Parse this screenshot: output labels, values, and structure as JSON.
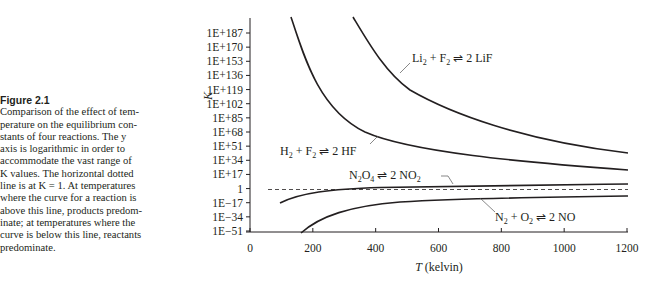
{
  "figure": {
    "label": "Figure 2.1",
    "caption_lines": [
      "Comparison of the effect of tem-",
      "perature on the equilibrium con-",
      "stants of four reactions. The y",
      "axis is logarithmic in order to",
      "accommodate the vast range of",
      "K values. The horizontal dotted",
      "line is at K = 1. At temperatures",
      "where the curve for a reaction is",
      "above this line, products predom-",
      "inate; at temperatures where the",
      "curve is below this line, reactants",
      "predominate."
    ]
  },
  "chart_data": {
    "type": "line",
    "title": "",
    "xlabel": "T (kelvin)",
    "ylabel": "K",
    "xlim": [
      0,
      1200
    ],
    "ylog": true,
    "ylim_log10": [
      -51,
      187
    ],
    "x_ticks": [
      "0",
      "200",
      "400",
      "600",
      "800",
      "1000",
      "1200"
    ],
    "y_ticks": [
      "1E+187",
      "1E+170",
      "1E+153",
      "1E+136",
      "1E+119",
      "1E+102",
      "1E+85",
      "1E+68",
      "1E+51",
      "1E+34",
      "1E+17",
      "1",
      "1E−17",
      "1E−34",
      "1E−51"
    ],
    "grid": false,
    "reference_line": {
      "y": 1,
      "style": "dashed",
      "label": "K = 1"
    },
    "series": [
      {
        "name": "Li2 + F2 ⇌ 2 LiF",
        "x_T": [
          328,
          400,
          450,
          600,
          800,
          1000,
          1200
        ],
        "log10_K": [
          205,
          163,
          140,
          109,
          85,
          65,
          44
        ]
      },
      {
        "name": "H2 + F2 ⇌ 2 HF",
        "x_T": [
          130,
          190,
          270,
          380,
          600,
          900,
          1200
        ],
        "log10_K": [
          205,
          155,
          94,
          65,
          45,
          31,
          23
        ]
      },
      {
        "name": "N2O4 ⇌ 2 NO2",
        "x_T": [
          100,
          200,
          300,
          400,
          600,
          900,
          1200
        ],
        "log10_K": [
          -17,
          -7,
          -1,
          1.5,
          3,
          5,
          6
        ]
      },
      {
        "name": "N2 + O2 ⇌ 2 NO",
        "x_T": [
          160,
          250,
          350,
          500,
          700,
          1000,
          1200
        ],
        "log10_K": [
          -51,
          -35,
          -25,
          -18,
          -13,
          -10,
          -8
        ]
      }
    ]
  },
  "labels": {
    "lif": {
      "main1": "Li",
      "sub1": "2",
      "main2": " + F",
      "sub2": "2",
      "arrow": " ⇌ ",
      "main3": "2 LiF"
    },
    "hf": {
      "main1": "H",
      "sub1": "2",
      "main2": " + F",
      "sub2": "2",
      "arrow": " ⇌ ",
      "main3": "2 HF"
    },
    "n2o4": {
      "main1": "N",
      "sub1": "2",
      "main2": "O",
      "sub2": "4",
      "arrow": " ⇌ ",
      "main3": "2 NO",
      "sub3": "2"
    },
    "no": {
      "main1": "N",
      "sub1": "2",
      "main2": " + O",
      "sub2": "2",
      "arrow": " ⇌ ",
      "main3": "2 NO"
    }
  }
}
